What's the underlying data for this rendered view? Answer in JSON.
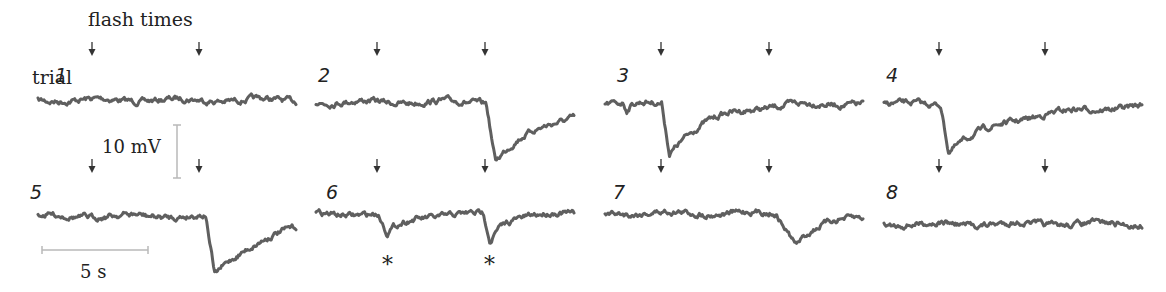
{
  "header": {
    "flash_label": "flash times",
    "trial_prefix": "trial"
  },
  "scale_bars": {
    "voltage": "10 mV",
    "time": "5 s"
  },
  "colors": {
    "trace": "#5f5f5f",
    "arrow": "#333333",
    "scalebar": "#b8b8b8",
    "text": "#222222"
  },
  "chart_data": {
    "type": "line",
    "xlabel": "time (s)",
    "ylabel": "membrane potential (mV)",
    "layout": "2 rows x 4 columns of small multiples, no axes; scale bars 10 mV (vertical) and 5 s (horizontal)",
    "flash_times_s": [
      2.5,
      7.5
    ],
    "trial_duration_s": 12,
    "annotations": [
      "flash times (arrows above each trace)",
      "* marks responses in trial 6"
    ],
    "series": [
      {
        "name": "1",
        "response_to_flash_1_mV": 0,
        "response_to_flash_2_mV": 0
      },
      {
        "name": "2",
        "response_to_flash_1_mV": 0,
        "response_to_flash_2_mV": -12
      },
      {
        "name": "3",
        "response_to_flash_1_mV": -11,
        "response_to_flash_2_mV": 0
      },
      {
        "name": "4",
        "response_to_flash_1_mV": -10,
        "response_to_flash_2_mV": 0
      },
      {
        "name": "5",
        "response_to_flash_1_mV": 0,
        "response_to_flash_2_mV": -13
      },
      {
        "name": "6",
        "response_to_flash_1_mV": -4,
        "response_to_flash_2_mV": -5,
        "marked": [
          "*",
          "*"
        ]
      },
      {
        "name": "7",
        "response_to_flash_1_mV": 0,
        "response_to_flash_2_mV": -6
      },
      {
        "name": "8",
        "response_to_flash_1_mV": 0,
        "response_to_flash_2_mV": 0
      }
    ]
  },
  "panels": [
    {
      "id": "1",
      "x0": 38,
      "base": 100,
      "arrows": [
        92,
        199
      ],
      "num_x": 55,
      "num_y": 82,
      "events": []
    },
    {
      "id": "2",
      "x0": 316,
      "base": 102,
      "arrows": [
        377,
        485
      ],
      "num_x": 318,
      "num_y": 82,
      "events": [
        {
          "t": 0.66,
          "d": 58,
          "w": 0.035,
          "r": 0.22
        }
      ]
    },
    {
      "id": "3",
      "x0": 605,
      "base": 103,
      "arrows": [
        661,
        769
      ],
      "num_x": 617,
      "num_y": 82,
      "events": [
        {
          "t": 0.22,
          "d": 50,
          "w": 0.03,
          "r": 0.15
        },
        {
          "t": 0.07,
          "d": 8,
          "w": 0.015,
          "r": 0.02
        }
      ]
    },
    {
      "id": "4",
      "x0": 884,
      "base": 104,
      "arrows": [
        939,
        1045
      ],
      "num_x": 886,
      "num_y": 82,
      "events": [
        {
          "t": 0.22,
          "d": 46,
          "w": 0.03,
          "r": 0.25
        }
      ]
    },
    {
      "id": "5",
      "x0": 38,
      "base": 216,
      "arrows": [
        92,
        199
      ],
      "num_x": 30,
      "num_y": 199,
      "events": [
        {
          "t": 0.65,
          "d": 60,
          "w": 0.035,
          "r": 0.2
        }
      ]
    },
    {
      "id": "6",
      "x0": 316,
      "base": 214,
      "arrows": [
        377,
        485
      ],
      "num_x": 326,
      "num_y": 199,
      "events": [
        {
          "t": 0.24,
          "d": 20,
          "w": 0.035,
          "r": 0.08
        },
        {
          "t": 0.65,
          "d": 28,
          "w": 0.025,
          "r": 0.05
        }
      ],
      "stars": [
        389,
        491
      ]
    },
    {
      "id": "7",
      "x0": 605,
      "base": 213,
      "arrows": [
        661,
        769
      ],
      "num_x": 613,
      "num_y": 199,
      "events": [
        {
          "t": 0.66,
          "d": 30,
          "w": 0.08,
          "r": 0.12
        }
      ]
    },
    {
      "id": "8",
      "x0": 884,
      "base": 224,
      "arrows": [
        939,
        1045
      ],
      "num_x": 886,
      "num_y": 199,
      "events": []
    }
  ]
}
